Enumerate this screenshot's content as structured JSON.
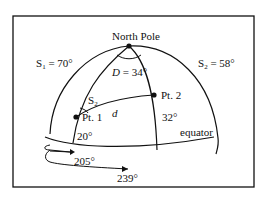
{
  "diagram": {
    "north_pole_label": "North Pole",
    "s1": {
      "prefix": "S",
      "sub": "1",
      "value": " = 70°"
    },
    "s2_top": {
      "prefix": "S",
      "sub": "2",
      "value": " = 58°"
    },
    "s2_angle": {
      "prefix": "S",
      "sub": "2"
    },
    "d_angle": {
      "var": "D",
      "value": " = 34°"
    },
    "distance_label": "d",
    "pt1_label": "Pt. 1",
    "pt2_label": "Pt. 2",
    "lat1_label": "20°",
    "lat2_label": "32°",
    "equator_label": "equator",
    "lon1_label": "205°",
    "lon2_label": "239°"
  }
}
